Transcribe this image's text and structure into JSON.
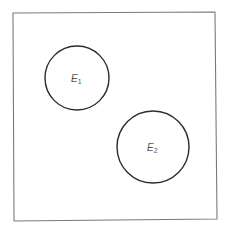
{
  "diagram": {
    "type": "venn",
    "sample_space": {
      "corners": {
        "x1": 13,
        "y1": 13,
        "x2": 216,
        "y2": 220
      },
      "stroke": "#7a7a7a"
    },
    "events": [
      {
        "name": "E",
        "subscript": "1",
        "label": "E1",
        "cx": 77,
        "cy": 78,
        "r": 32,
        "label_x": 71,
        "label_y": 82
      },
      {
        "name": "E",
        "subscript": "2",
        "label": "E2",
        "cx": 153,
        "cy": 147,
        "r": 36,
        "label_x": 147,
        "label_y": 151
      }
    ],
    "circle_stroke": "#2b2b2b",
    "relationship": "disjoint"
  }
}
